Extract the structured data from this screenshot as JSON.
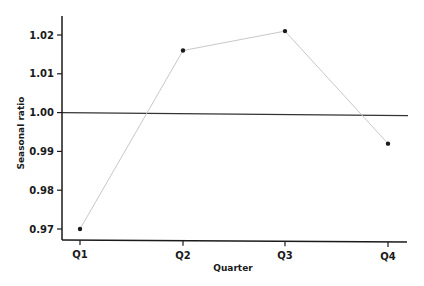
{
  "chart_data": {
    "type": "line",
    "title": "",
    "xlabel": "Quarter",
    "ylabel": "Seasonal ratio",
    "categories": [
      "Q1",
      "Q2",
      "Q3",
      "Q4"
    ],
    "series": [
      {
        "name": "Seasonal ratio",
        "values": [
          0.97,
          1.016,
          1.021,
          0.992
        ],
        "color": "#c8c8c8",
        "marker_color": "#1a1a1a"
      }
    ],
    "reference_line": {
      "y": 1.0,
      "color": "#333333"
    },
    "ylim": [
      0.967,
      1.024
    ],
    "yticks": [
      0.97,
      0.98,
      0.99,
      1.0,
      1.01,
      1.02
    ],
    "ytick_labels": [
      "0.97",
      "0.98",
      "0.99",
      "1.00",
      "1.01",
      "1.02"
    ],
    "grid": false,
    "legend": null
  }
}
